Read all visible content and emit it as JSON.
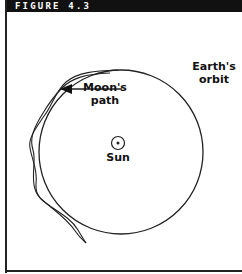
{
  "figure": {
    "title": "FIGURE 4.3"
  },
  "labels": {
    "moon_path_line1": "Moon's",
    "moon_path_line2": "path",
    "earth_orbit_line1": "Earth's",
    "earth_orbit_line2": "orbit",
    "sun": "Sun"
  },
  "icons": {
    "sun_symbol": "sun-symbol-circle-dot",
    "arrow": "arrow-left"
  },
  "colors": {
    "title_bar": "#111111",
    "title_text": "#ffffff",
    "lines": "#222222",
    "background": "#ffffff"
  }
}
